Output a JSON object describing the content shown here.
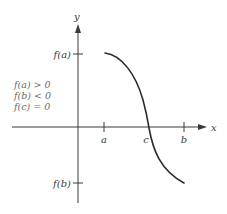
{
  "figure": {
    "axes": {
      "x_label": "x",
      "y_label": "y"
    },
    "x_ticks": [
      {
        "label": "a",
        "x": 104
      },
      {
        "label": "c",
        "x": 148
      },
      {
        "label": "b",
        "x": 184
      }
    ],
    "y_ticks": [
      {
        "label": "f(a)",
        "y": 54
      },
      {
        "label": "f(b)",
        "y": 183
      }
    ],
    "conditions": [
      "f(a) > 0",
      "f(b) < 0",
      "f(c) = 0"
    ],
    "curve": {
      "description": "decreasing continuous function from (a, f(a)) to (b, f(b)) crossing x-axis at c",
      "color": "#2b2b2b"
    },
    "colors": {
      "axis": "#3a3a3a",
      "text": "#3a3a3a",
      "condition_text": "#6a6a6a",
      "background": "#ffffff"
    }
  }
}
